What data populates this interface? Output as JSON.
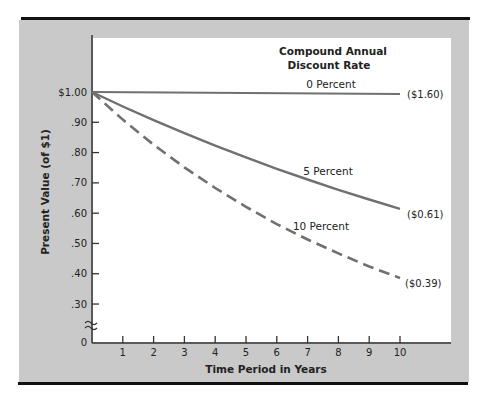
{
  "chart_data": {
    "type": "line",
    "title": "Compound Annual Discount Rate",
    "title_lines": [
      "Compound Annual",
      "Discount Rate"
    ],
    "xlabel": "Time Period in Years",
    "ylabel": "Present Value (of $1)",
    "x": [
      0,
      1,
      2,
      3,
      4,
      5,
      6,
      7,
      8,
      9,
      10
    ],
    "x_tick_labels": [
      "1",
      "2",
      "3",
      "4",
      "5",
      "6",
      "7",
      "8",
      "9",
      "10"
    ],
    "y_tick_labels": [
      "$1.00",
      ".90",
      ".80",
      ".70",
      ".60",
      ".50",
      ".40",
      ".30",
      "0"
    ],
    "y_ticks": [
      1.0,
      0.9,
      0.8,
      0.7,
      0.6,
      0.5,
      0.4,
      0.3
    ],
    "ylim": [
      0,
      1.0
    ],
    "y_axis_break": true,
    "grid": false,
    "series": [
      {
        "name": "0 Percent",
        "style": "solid",
        "end_label": "($1.60)",
        "values": [
          1.0,
          1.0,
          1.0,
          1.0,
          1.0,
          1.0,
          1.0,
          1.0,
          1.0,
          1.0,
          1.0
        ]
      },
      {
        "name": "5 Percent",
        "style": "solid",
        "end_label": "($0.61)",
        "values": [
          1.0,
          0.952,
          0.907,
          0.864,
          0.823,
          0.784,
          0.746,
          0.711,
          0.677,
          0.645,
          0.614
        ]
      },
      {
        "name": "10 Percent",
        "style": "dashed",
        "end_label": "($0.39)",
        "values": [
          1.0,
          0.909,
          0.826,
          0.751,
          0.683,
          0.621,
          0.564,
          0.513,
          0.467,
          0.424,
          0.386
        ]
      }
    ]
  },
  "colors": {
    "panel": "#c9c9c9",
    "line": "#707070",
    "rule": "#111111"
  }
}
